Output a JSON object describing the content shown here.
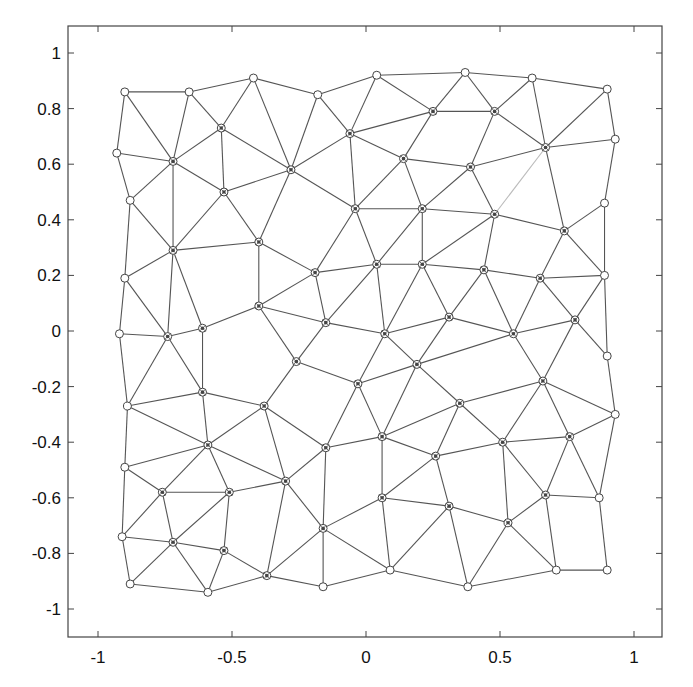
{
  "chart_data": {
    "type": "scatter",
    "subtype": "triangular-mesh",
    "title": "",
    "xlabel": "",
    "ylabel": "",
    "xlim": [
      -1.1,
      1.1
    ],
    "ylim": [
      -1.1,
      1.1
    ],
    "xticks": [
      -1,
      -0.5,
      0,
      0.5,
      1
    ],
    "xtick_labels": [
      "-1",
      "-0.5",
      "0",
      "0.5",
      "1"
    ],
    "yticks": [
      1,
      0.8,
      0.6,
      0.4,
      0.2,
      0,
      -0.2,
      -0.4,
      -0.6,
      -0.8,
      -1
    ],
    "ytick_labels": [
      "1",
      "0.8",
      "0.6",
      "0.4",
      "0.2",
      "0",
      "-0.2",
      "-0.4",
      "-0.6",
      "-0.8",
      "-1"
    ],
    "grid": false,
    "legend": null,
    "marker": "circle (boundary: open circle; interior: circle with star)",
    "line_color": "#555555",
    "marker_color": "#444444",
    "nodes": [
      [
        -0.9,
        0.86
      ],
      [
        -0.66,
        0.86
      ],
      [
        -0.42,
        0.91
      ],
      [
        -0.18,
        0.85
      ],
      [
        0.04,
        0.92
      ],
      [
        0.37,
        0.93
      ],
      [
        0.62,
        0.91
      ],
      [
        0.9,
        0.87
      ],
      [
        -0.93,
        0.64
      ],
      [
        -0.72,
        0.61
      ],
      [
        -0.54,
        0.73
      ],
      [
        -0.28,
        0.58
      ],
      [
        -0.06,
        0.71
      ],
      [
        0.25,
        0.79
      ],
      [
        0.48,
        0.79
      ],
      [
        0.67,
        0.66
      ],
      [
        0.93,
        0.69
      ],
      [
        -0.88,
        0.47
      ],
      [
        -0.53,
        0.5
      ],
      [
        0.14,
        0.62
      ],
      [
        0.39,
        0.59
      ],
      [
        -0.72,
        0.29
      ],
      [
        -0.4,
        0.32
      ],
      [
        -0.04,
        0.44
      ],
      [
        0.21,
        0.44
      ],
      [
        0.48,
        0.42
      ],
      [
        0.89,
        0.46
      ],
      [
        0.74,
        0.36
      ],
      [
        -0.9,
        0.19
      ],
      [
        -0.19,
        0.21
      ],
      [
        0.04,
        0.24
      ],
      [
        0.21,
        0.24
      ],
      [
        0.44,
        0.22
      ],
      [
        0.65,
        0.19
      ],
      [
        0.89,
        0.2
      ],
      [
        -0.92,
        -0.01
      ],
      [
        -0.74,
        -0.02
      ],
      [
        -0.61,
        0.01
      ],
      [
        -0.4,
        0.09
      ],
      [
        -0.15,
        0.03
      ],
      [
        0.07,
        -0.01
      ],
      [
        0.31,
        0.05
      ],
      [
        0.55,
        -0.01
      ],
      [
        0.78,
        0.04
      ],
      [
        0.9,
        -0.09
      ],
      [
        -0.26,
        -0.11
      ],
      [
        0.19,
        -0.12
      ],
      [
        -0.03,
        -0.19
      ],
      [
        -0.61,
        -0.22
      ],
      [
        -0.89,
        -0.27
      ],
      [
        -0.38,
        -0.27
      ],
      [
        0.35,
        -0.26
      ],
      [
        0.66,
        -0.18
      ],
      [
        0.93,
        -0.3
      ],
      [
        -0.59,
        -0.41
      ],
      [
        -0.15,
        -0.42
      ],
      [
        0.06,
        -0.38
      ],
      [
        0.51,
        -0.4
      ],
      [
        0.76,
        -0.38
      ],
      [
        0.26,
        -0.45
      ],
      [
        -0.9,
        -0.49
      ],
      [
        -0.76,
        -0.58
      ],
      [
        -0.51,
        -0.58
      ],
      [
        -0.3,
        -0.54
      ],
      [
        0.06,
        -0.6
      ],
      [
        0.31,
        -0.63
      ],
      [
        0.53,
        -0.69
      ],
      [
        0.67,
        -0.59
      ],
      [
        0.87,
        -0.6
      ],
      [
        -0.91,
        -0.74
      ],
      [
        -0.72,
        -0.76
      ],
      [
        -0.53,
        -0.79
      ],
      [
        -0.16,
        -0.71
      ],
      [
        -0.88,
        -0.91
      ],
      [
        -0.59,
        -0.94
      ],
      [
        -0.37,
        -0.88
      ],
      [
        -0.16,
        -0.92
      ],
      [
        0.09,
        -0.86
      ],
      [
        0.38,
        -0.92
      ],
      [
        0.71,
        -0.86
      ],
      [
        0.9,
        -0.86
      ]
    ],
    "boundary_nodes": [
      0,
      1,
      2,
      3,
      4,
      5,
      6,
      7,
      8,
      16,
      17,
      26,
      28,
      34,
      35,
      44,
      49,
      53,
      60,
      68,
      69,
      73,
      74,
      76,
      77,
      78,
      79,
      80
    ],
    "edges": [
      [
        0,
        1
      ],
      [
        1,
        2
      ],
      [
        2,
        3
      ],
      [
        3,
        4
      ],
      [
        4,
        5
      ],
      [
        5,
        6
      ],
      [
        6,
        7
      ],
      [
        0,
        8
      ],
      [
        0,
        9
      ],
      [
        1,
        9
      ],
      [
        1,
        10
      ],
      [
        2,
        10
      ],
      [
        2,
        11
      ],
      [
        3,
        11
      ],
      [
        3,
        12
      ],
      [
        4,
        12
      ],
      [
        4,
        13
      ],
      [
        5,
        13
      ],
      [
        5,
        14
      ],
      [
        6,
        14
      ],
      [
        6,
        15
      ],
      [
        7,
        15
      ],
      [
        7,
        16
      ],
      [
        8,
        9
      ],
      [
        8,
        17
      ],
      [
        9,
        10
      ],
      [
        9,
        17
      ],
      [
        9,
        18
      ],
      [
        9,
        21
      ],
      [
        10,
        11
      ],
      [
        10,
        18
      ],
      [
        11,
        18
      ],
      [
        11,
        12
      ],
      [
        11,
        22
      ],
      [
        11,
        23
      ],
      [
        12,
        13
      ],
      [
        12,
        19
      ],
      [
        12,
        23
      ],
      [
        13,
        14
      ],
      [
        13,
        19
      ],
      [
        14,
        20
      ],
      [
        14,
        15
      ],
      [
        15,
        16
      ],
      [
        15,
        20
      ],
      [
        15,
        27
      ],
      [
        15,
        25
      ],
      [
        16,
        26
      ],
      [
        17,
        21
      ],
      [
        17,
        28
      ],
      [
        18,
        21
      ],
      [
        18,
        22
      ],
      [
        19,
        20
      ],
      [
        19,
        23
      ],
      [
        19,
        24
      ],
      [
        20,
        24
      ],
      [
        20,
        25
      ],
      [
        21,
        22
      ],
      [
        21,
        28
      ],
      [
        21,
        36
      ],
      [
        21,
        37
      ],
      [
        22,
        29
      ],
      [
        22,
        38
      ],
      [
        23,
        24
      ],
      [
        23,
        29
      ],
      [
        23,
        30
      ],
      [
        24,
        30
      ],
      [
        24,
        31
      ],
      [
        24,
        25
      ],
      [
        25,
        31
      ],
      [
        25,
        32
      ],
      [
        25,
        27
      ],
      [
        26,
        27
      ],
      [
        26,
        34
      ],
      [
        27,
        33
      ],
      [
        27,
        34
      ],
      [
        28,
        35
      ],
      [
        28,
        36
      ],
      [
        29,
        30
      ],
      [
        29,
        38
      ],
      [
        29,
        39
      ],
      [
        30,
        31
      ],
      [
        30,
        39
      ],
      [
        30,
        40
      ],
      [
        31,
        32
      ],
      [
        31,
        40
      ],
      [
        31,
        41
      ],
      [
        32,
        33
      ],
      [
        32,
        41
      ],
      [
        32,
        42
      ],
      [
        33,
        34
      ],
      [
        33,
        42
      ],
      [
        33,
        43
      ],
      [
        34,
        43
      ],
      [
        34,
        44
      ],
      [
        35,
        36
      ],
      [
        35,
        49
      ],
      [
        36,
        37
      ],
      [
        36,
        49
      ],
      [
        36,
        48
      ],
      [
        37,
        38
      ],
      [
        37,
        48
      ],
      [
        38,
        39
      ],
      [
        38,
        45
      ],
      [
        39,
        40
      ],
      [
        39,
        45
      ],
      [
        40,
        41
      ],
      [
        40,
        47
      ],
      [
        40,
        46
      ],
      [
        41,
        46
      ],
      [
        41,
        42
      ],
      [
        42,
        46
      ],
      [
        42,
        52
      ],
      [
        42,
        43
      ],
      [
        43,
        44
      ],
      [
        43,
        52
      ],
      [
        44,
        53
      ],
      [
        45,
        47
      ],
      [
        45,
        50
      ],
      [
        46,
        47
      ],
      [
        46,
        51
      ],
      [
        46,
        56
      ],
      [
        47,
        55
      ],
      [
        47,
        56
      ],
      [
        48,
        49
      ],
      [
        48,
        50
      ],
      [
        48,
        54
      ],
      [
        49,
        54
      ],
      [
        49,
        60
      ],
      [
        50,
        54
      ],
      [
        50,
        55
      ],
      [
        50,
        63
      ],
      [
        51,
        52
      ],
      [
        51,
        56
      ],
      [
        51,
        59
      ],
      [
        51,
        57
      ],
      [
        52,
        53
      ],
      [
        52,
        57
      ],
      [
        52,
        58
      ],
      [
        53,
        58
      ],
      [
        53,
        68
      ],
      [
        54,
        60
      ],
      [
        54,
        61
      ],
      [
        54,
        62
      ],
      [
        54,
        63
      ],
      [
        55,
        56
      ],
      [
        55,
        63
      ],
      [
        55,
        72
      ],
      [
        56,
        59
      ],
      [
        56,
        64
      ],
      [
        57,
        59
      ],
      [
        57,
        58
      ],
      [
        57,
        66
      ],
      [
        57,
        67
      ],
      [
        58,
        67
      ],
      [
        58,
        68
      ],
      [
        59,
        64
      ],
      [
        59,
        65
      ],
      [
        60,
        61
      ],
      [
        60,
        69
      ],
      [
        61,
        62
      ],
      [
        61,
        69
      ],
      [
        61,
        70
      ],
      [
        62,
        63
      ],
      [
        62,
        70
      ],
      [
        62,
        71
      ],
      [
        63,
        72
      ],
      [
        63,
        75
      ],
      [
        64,
        65
      ],
      [
        64,
        72
      ],
      [
        64,
        77
      ],
      [
        65,
        66
      ],
      [
        65,
        77
      ],
      [
        65,
        78
      ],
      [
        66,
        67
      ],
      [
        66,
        78
      ],
      [
        66,
        79
      ],
      [
        67,
        68
      ],
      [
        67,
        79
      ],
      [
        68,
        80
      ],
      [
        69,
        70
      ],
      [
        69,
        73
      ],
      [
        70,
        71
      ],
      [
        70,
        73
      ],
      [
        70,
        74
      ],
      [
        71,
        74
      ],
      [
        71,
        75
      ],
      [
        72,
        75
      ],
      [
        72,
        76
      ],
      [
        72,
        77
      ],
      [
        73,
        74
      ],
      [
        74,
        75
      ],
      [
        75,
        76
      ],
      [
        76,
        77
      ],
      [
        77,
        78
      ],
      [
        78,
        79
      ],
      [
        79,
        80
      ]
    ],
    "faint_edges": [
      [
        15,
        25
      ]
    ]
  },
  "caption": {
    "visible_fragments": [
      "~",
      "2"
    ]
  }
}
